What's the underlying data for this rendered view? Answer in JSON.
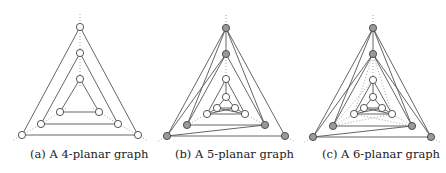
{
  "figure": {
    "subfigures": [
      {
        "id": "a",
        "caption": "(a) A 4-planar graph",
        "caption_x": 30,
        "vertices": [
          {
            "x": 80,
            "y": 27,
            "fill": "white"
          },
          {
            "x": 80,
            "y": 53,
            "fill": "white"
          },
          {
            "x": 80,
            "y": 79,
            "fill": "white"
          },
          {
            "x": 60,
            "y": 112,
            "fill": "white"
          },
          {
            "x": 99,
            "y": 112,
            "fill": "white"
          },
          {
            "x": 41,
            "y": 124,
            "fill": "white"
          },
          {
            "x": 118,
            "y": 124,
            "fill": "white"
          },
          {
            "x": 22,
            "y": 135,
            "fill": "white"
          },
          {
            "x": 138,
            "y": 135,
            "fill": "white"
          }
        ],
        "edges": [
          [
            0,
            7
          ],
          [
            0,
            8
          ],
          [
            7,
            8
          ],
          [
            1,
            5
          ],
          [
            1,
            6
          ],
          [
            5,
            6
          ],
          [
            2,
            3
          ],
          [
            2,
            4
          ],
          [
            3,
            4
          ]
        ],
        "dotted_edges": [
          [
            0,
            1
          ],
          [
            1,
            2
          ],
          [
            7,
            5
          ],
          [
            5,
            3
          ],
          [
            8,
            6
          ],
          [
            6,
            4
          ]
        ],
        "dotted_extensions": [
          [
            80,
            14,
            80,
            27
          ],
          [
            80,
            79,
            80,
            88
          ],
          [
            22,
            135,
            12,
            141
          ],
          [
            138,
            135,
            148,
            141
          ],
          [
            60,
            112,
            67,
            108
          ],
          [
            99,
            112,
            92,
            108
          ]
        ]
      },
      {
        "id": "b",
        "caption": "(b) A 5-planar graph",
        "caption_x": 175,
        "vertices": [
          {
            "x": 226,
            "y": 28,
            "fill": "gray"
          },
          {
            "x": 226,
            "y": 54,
            "fill": "gray"
          },
          {
            "x": 226,
            "y": 79,
            "fill": "white"
          },
          {
            "x": 226,
            "y": 97,
            "fill": "white"
          },
          {
            "x": 217,
            "y": 108,
            "fill": "white"
          },
          {
            "x": 235,
            "y": 108,
            "fill": "white"
          },
          {
            "x": 207,
            "y": 114,
            "fill": "white"
          },
          {
            "x": 245,
            "y": 114,
            "fill": "white"
          },
          {
            "x": 187,
            "y": 125,
            "fill": "gray"
          },
          {
            "x": 265,
            "y": 125,
            "fill": "gray"
          },
          {
            "x": 167,
            "y": 136,
            "fill": "gray"
          },
          {
            "x": 285,
            "y": 136,
            "fill": "gray"
          }
        ],
        "edges": [
          [
            0,
            10
          ],
          [
            0,
            11
          ],
          [
            10,
            11
          ],
          [
            0,
            8
          ],
          [
            0,
            9
          ],
          [
            0,
            1
          ],
          [
            1,
            8
          ],
          [
            1,
            9
          ],
          [
            10,
            9
          ],
          [
            8,
            9
          ],
          [
            1,
            10
          ],
          [
            2,
            6
          ],
          [
            2,
            7
          ],
          [
            6,
            7
          ],
          [
            2,
            3
          ],
          [
            3,
            4
          ],
          [
            3,
            5
          ],
          [
            4,
            5
          ],
          [
            4,
            6
          ],
          [
            5,
            7
          ],
          [
            6,
            5
          ],
          [
            4,
            7
          ]
        ],
        "dotted_edges": [
          [
            1,
            2
          ],
          [
            8,
            6
          ],
          [
            9,
            7
          ]
        ],
        "dotted_extensions": [
          [
            226,
            15,
            226,
            28
          ],
          [
            167,
            136,
            157,
            142
          ],
          [
            285,
            136,
            295,
            142
          ]
        ]
      },
      {
        "id": "c",
        "caption": "(c) A 6-planar graph",
        "caption_x": 322,
        "vertices": [
          {
            "x": 373,
            "y": 28,
            "fill": "gray"
          },
          {
            "x": 373,
            "y": 54,
            "fill": "gray"
          },
          {
            "x": 373,
            "y": 80,
            "fill": "white"
          },
          {
            "x": 373,
            "y": 97,
            "fill": "white"
          },
          {
            "x": 364,
            "y": 108,
            "fill": "white"
          },
          {
            "x": 382,
            "y": 108,
            "fill": "white"
          },
          {
            "x": 354,
            "y": 114,
            "fill": "white"
          },
          {
            "x": 392,
            "y": 114,
            "fill": "white"
          },
          {
            "x": 333,
            "y": 126,
            "fill": "gray"
          },
          {
            "x": 412,
            "y": 126,
            "fill": "gray"
          },
          {
            "x": 313,
            "y": 137,
            "fill": "gray"
          },
          {
            "x": 431,
            "y": 137,
            "fill": "gray"
          }
        ],
        "edges": [
          [
            0,
            10
          ],
          [
            0,
            11
          ],
          [
            10,
            11
          ],
          [
            0,
            8
          ],
          [
            0,
            9
          ],
          [
            0,
            1
          ],
          [
            1,
            8
          ],
          [
            1,
            9
          ],
          [
            10,
            9
          ],
          [
            8,
            9
          ],
          [
            1,
            10
          ],
          [
            1,
            11
          ],
          [
            2,
            6
          ],
          [
            2,
            7
          ],
          [
            6,
            7
          ],
          [
            2,
            3
          ],
          [
            3,
            4
          ],
          [
            3,
            5
          ],
          [
            4,
            5
          ],
          [
            4,
            6
          ],
          [
            5,
            7
          ],
          [
            6,
            5
          ],
          [
            4,
            7
          ]
        ],
        "dotted_edges": [
          [
            1,
            2
          ],
          [
            8,
            6
          ],
          [
            9,
            7
          ],
          [
            1,
            6
          ],
          [
            1,
            7
          ],
          [
            8,
            7
          ],
          [
            9,
            6
          ],
          [
            8,
            2
          ]
        ],
        "dotted_extensions": [
          [
            373,
            15,
            373,
            28
          ],
          [
            313,
            137,
            303,
            143
          ],
          [
            431,
            137,
            441,
            143
          ]
        ]
      }
    ]
  },
  "colors": {
    "edge": "#555555",
    "dotted": "#999999",
    "vertex_gray": "#9a9a9a",
    "vertex_white": "#ffffff",
    "vertex_stroke": "#444444"
  }
}
